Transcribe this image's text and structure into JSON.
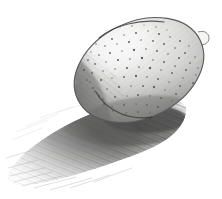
{
  "artwork": {
    "title": "Pencil study of a lemon with cast shadow",
    "medium": "graphite pencil on white paper",
    "subject_label": "lemon",
    "shadow_label": "cast shadow",
    "background_color": "#ffffff",
    "canvas": {
      "width": 222,
      "height": 199
    }
  },
  "palette": {
    "paper_white": "#ffffff",
    "lightest_tone": "#f2f2f0",
    "light_tone": "#dedede",
    "mid_tone": "#b4b4b2",
    "dark_tone": "#7c7c7a",
    "darkest_tone": "#4a4a48",
    "outline": "#58585a",
    "stipple": "#5c5c5a"
  },
  "fruit": {
    "name": "lemon-body",
    "center_x": 139,
    "center_y": 70,
    "radius_x": 68,
    "radius_y": 48,
    "rotation_deg": -26,
    "highlight": {
      "name": "specular-highlight",
      "cx": 120,
      "cy": 48,
      "rx": 40,
      "ry": 26,
      "tone": "#ffffff"
    },
    "core_shadow": {
      "name": "terminator-crescent",
      "side": "left",
      "tone": "#5a5a58"
    },
    "stem_nub": {
      "name": "stem-nub",
      "x": 203,
      "y": 38
    },
    "texture": {
      "kind": "stipple-pores",
      "dot_count": 150,
      "dot_radius_min": 0.5,
      "dot_radius_max": 1.35
    }
  },
  "shadow": {
    "name": "cast-shadow",
    "direction": "lower-left",
    "anchor_x": 150,
    "anchor_y": 118,
    "extent_left_x": 8,
    "extent_bottom_y": 186,
    "core_tone": "#5f5f5e",
    "edge_tone": "#e6e6e5",
    "hatch_angle_deg": 22
  }
}
